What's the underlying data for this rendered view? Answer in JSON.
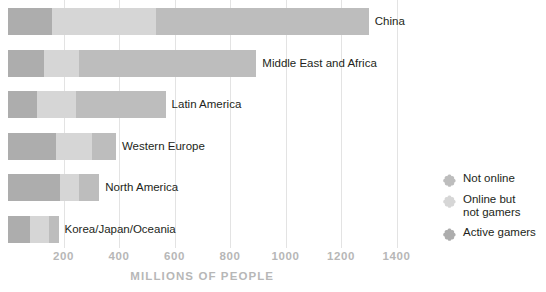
{
  "chart_data": {
    "type": "bar",
    "orientation": "horizontal",
    "stacked": true,
    "title": "",
    "xlabel": "MILLIONS OF PEOPLE",
    "ylabel": "",
    "xlim": [
      0,
      1450
    ],
    "xticks": [
      200,
      400,
      600,
      800,
      1000,
      1200,
      1400
    ],
    "xtick_labels": [
      "200",
      "400",
      "600",
      "800",
      "1000",
      "1200",
      "1400"
    ],
    "grid": true,
    "legend_position": "right",
    "categories": [
      "China",
      "Middle East and Africa",
      "Latin America",
      "Western Europe",
      "North America",
      "Korea/Japan/Oceania"
    ],
    "series": [
      {
        "name": "Active gamers",
        "color": "#adadad",
        "values": [
          160,
          130,
          103,
          173,
          187,
          79
        ]
      },
      {
        "name": "Online but not gamers",
        "color": "#d6d6d6",
        "values": [
          372,
          125,
          142,
          131,
          69,
          70
        ]
      },
      {
        "name": "Not online",
        "color": "#bdbdbd",
        "values": [
          768,
          640,
          323,
          85,
          73,
          33
        ]
      }
    ],
    "totals": [
      1300,
      895,
      568,
      389,
      329,
      182
    ]
  },
  "legend": {
    "items": [
      {
        "label_lines": [
          "Not online"
        ],
        "color": "#bdbdbd",
        "marker": "clover-marker"
      },
      {
        "label_lines": [
          "Online but",
          "not gamers"
        ],
        "color": "#d6d6d6",
        "marker": "clover-marker"
      },
      {
        "label_lines": [
          "Active gamers"
        ],
        "color": "#adadad",
        "marker": "clover-marker"
      }
    ]
  }
}
